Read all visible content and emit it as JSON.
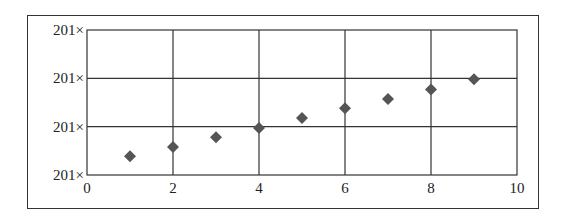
{
  "chart_data": {
    "type": "scatter",
    "title": "",
    "xlabel": "",
    "ylabel": "",
    "xlim": [
      0,
      10
    ],
    "ylim": [
      0,
      3
    ],
    "grid": true,
    "legend": null,
    "marker": "diamond",
    "marker_color": "#555555",
    "x_ticks": [
      "0",
      "2",
      "4",
      "6",
      "8",
      "10"
    ],
    "y_ticks": [
      "201×",
      "201×",
      "201×",
      "201×"
    ],
    "y_tick_note": "y tick labels are truncated in the image; y values below are expressed in gridline units (bottom gridline = 0, top = 3)",
    "series": [
      {
        "name": "series-1",
        "x": [
          1,
          2,
          3,
          4,
          5,
          6,
          7,
          8,
          9
        ],
        "y": [
          0.39,
          0.58,
          0.78,
          0.97,
          1.18,
          1.38,
          1.57,
          1.77,
          1.98
        ]
      }
    ]
  }
}
